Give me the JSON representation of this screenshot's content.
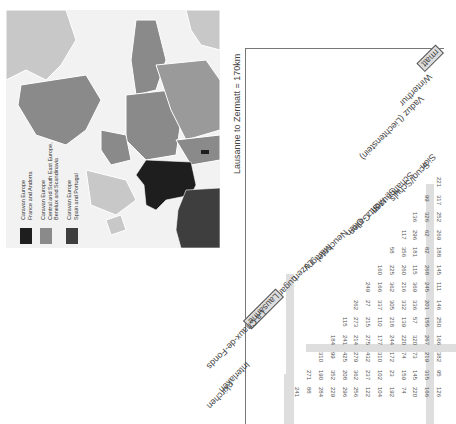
{
  "map": {
    "colors": {
      "france_andorra": "#1e1e1e",
      "central_se_europe": "#8a8a8a",
      "scandinavia_light": "#c8c8c8",
      "spain_portugal": "#3e3e3e",
      "sea": "#f2f2f2",
      "border": "#ffffff"
    },
    "legend": [
      {
        "swatch": "#1e1e1e",
        "line1": "Caravan Europe",
        "line2": "France and Andorra",
        "line3": ""
      },
      {
        "swatch": "#8a8a8a",
        "line1": "Caravan Europe",
        "line2": "Central and South East Europe,",
        "line3": "Benelux and Scandinavia"
      },
      {
        "swatch": "#3e3e3e",
        "line1": "Caravan Europe",
        "line2": "Spain and Portugal",
        "line3": ""
      }
    ]
  },
  "distance_chart": {
    "title": "Lausanne to Zermatt = 170km",
    "towns": [
      "Zermatt",
      "Winterthur",
      "Vaduz (Liechtenstein)",
      "Sion",
      "Scuol/Schuls",
      "Schaffhausen",
      "St. Moritz",
      "St. Gallen",
      "Olten",
      "Neuchatel",
      "Martigny",
      "Luzern",
      "Lugano",
      "Lausanne",
      "La Chaux-de-Fonds",
      "Interlaken",
      "Grindelwald/Kandersteg (partial)"
    ],
    "highlighted_town": "Lausanne",
    "visible_town_fragments": {
      "top_right": "rmatt",
      "bottom_left": "nkirchen"
    },
    "columns": [
      {
        "town": "Sion",
        "values": [
          "221"
        ]
      },
      {
        "town": "Scuol/Schuls",
        "values": [
          "317",
          "99"
        ]
      },
      {
        "town": "Schaffhausen",
        "values": [
          "252",
          "326",
          "136"
        ]
      },
      {
        "town": "St. Moritz",
        "values": [
          "269",
          "62",
          "296",
          "117"
        ]
      },
      {
        "town": "St. Gallen",
        "values": [
          "188",
          "82",
          "181",
          "356",
          "58"
        ]
      },
      {
        "town": "Olten",
        "values": [
          "145",
          "268",
          "115",
          "260",
          "225",
          "160"
        ]
      },
      {
        "town": "Neuchatel",
        "values": [
          "111",
          "245",
          "369",
          "216",
          "362",
          "166",
          "249"
        ]
      },
      {
        "town": "Martigny",
        "values": [
          "146",
          "201",
          "336",
          "332",
          "305",
          "337",
          "27",
          "262"
        ]
      },
      {
        "town": "Luzern",
        "values": [
          "250",
          "155",
          "57",
          "139",
          "218",
          "110",
          "215",
          "273",
          "115"
        ]
      },
      {
        "town": "Lugano",
        "values": [
          "166",
          "267",
          "320",
          "220",
          "244",
          "177",
          "275",
          "214",
          "241",
          "184"
        ]
      },
      {
        "town": "Lausanne",
        "values": [
          "382",
          "219",
          "73",
          "74",
          "172",
          "310",
          "432",
          "279",
          "425",
          "99",
          "310"
        ]
      },
      {
        "town": "La Chaux-de-Fonds",
        "values": [
          "95",
          "315",
          "145",
          "159",
          "23",
          "102",
          "237",
          "362",
          "208",
          "352",
          "190",
          "271"
        ]
      },
      {
        "town": "Interlaken",
        "values": [
          "126",
          "166",
          "220",
          "74",
          "192",
          "104",
          "122",
          "256",
          "296",
          "229",
          "284",
          "88",
          "241"
        ]
      }
    ]
  }
}
